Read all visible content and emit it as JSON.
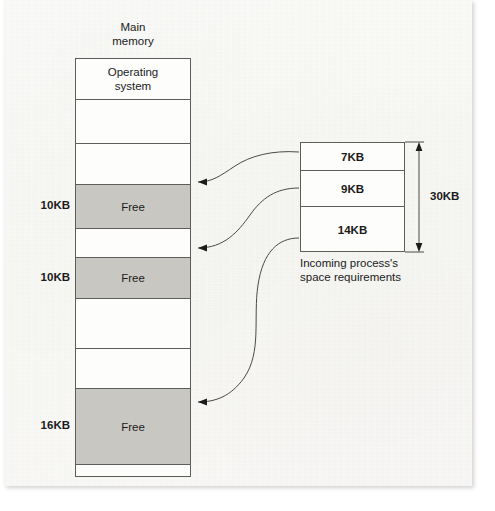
{
  "figure": {
    "main_memory_title": "Main\nmemory",
    "process_caption": "Incoming process's\nspace requirements",
    "total_size_label": "30KB"
  },
  "colors": {
    "free_block": "#c9c7c2",
    "line": "#5d5d5a",
    "text": "#1b1b1b",
    "paper": "#f9f8f6"
  },
  "main_memory": {
    "title": "Main memory",
    "blocks": [
      {
        "label": "Operating\nsystem",
        "size": "",
        "state": "used",
        "top": 0,
        "height": 41
      },
      {
        "label": "",
        "size": "",
        "state": "used",
        "top": 41,
        "height": 44
      },
      {
        "label": "",
        "size": "",
        "state": "used",
        "top": 85,
        "height": 41
      },
      {
        "label": "Free",
        "size": "10KB",
        "state": "free",
        "top": 126,
        "height": 44
      },
      {
        "label": "",
        "size": "",
        "state": "used",
        "top": 170,
        "height": 29
      },
      {
        "label": "Free",
        "size": "10KB",
        "state": "free",
        "top": 199,
        "height": 41
      },
      {
        "label": "",
        "size": "",
        "state": "used",
        "top": 240,
        "height": 50
      },
      {
        "label": "",
        "size": "",
        "state": "used",
        "top": 290,
        "height": 40
      },
      {
        "label": "Free",
        "size": "16KB",
        "state": "free",
        "top": 330,
        "height": 76
      },
      {
        "label": "",
        "size": "",
        "state": "used",
        "top": 406,
        "height": 43
      }
    ]
  },
  "incoming_process": {
    "caption_line1": "Incoming process's",
    "caption_line2": "space requirements",
    "total": "30KB",
    "segments": [
      {
        "label": "7KB",
        "top": 0,
        "height": 28
      },
      {
        "label": "9KB",
        "top": 28,
        "height": 36
      },
      {
        "label": "14KB",
        "top": 64,
        "height": 46
      }
    ]
  },
  "arrows": [
    {
      "from_segment": "7KB",
      "to_block": "10KB-free-1"
    },
    {
      "from_segment": "9KB",
      "to_block": "10KB-free-2"
    },
    {
      "from_segment": "14KB",
      "to_block": "16KB-free"
    }
  ]
}
